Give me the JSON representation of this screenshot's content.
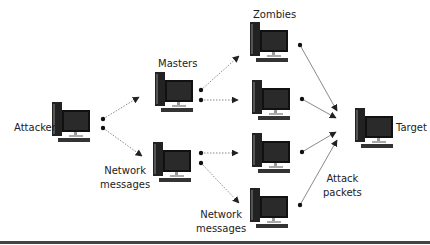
{
  "diagram": {
    "nodes": {
      "attacker": {
        "label": "Attacker"
      },
      "masters": {
        "label": "Masters",
        "count": 2
      },
      "zombies": {
        "label": "Zombies",
        "count": 4
      },
      "target": {
        "label": "Target"
      }
    },
    "annotations": {
      "network_messages_1_line1": "Network",
      "network_messages_1_line2": "messages",
      "network_messages_2_line1": "Network",
      "network_messages_2_line2": "messages",
      "attack_packets_line1": "Attack",
      "attack_packets_line2": "packets"
    },
    "edges": [
      {
        "from": "attacker",
        "to": "master-1"
      },
      {
        "from": "attacker",
        "to": "master-2"
      },
      {
        "from": "master-1",
        "to": "zombie-1"
      },
      {
        "from": "master-1",
        "to": "zombie-2"
      },
      {
        "from": "master-2",
        "to": "zombie-3"
      },
      {
        "from": "master-2",
        "to": "zombie-4"
      },
      {
        "from": "zombie-1",
        "to": "target"
      },
      {
        "from": "zombie-2",
        "to": "target"
      },
      {
        "from": "zombie-3",
        "to": "target"
      },
      {
        "from": "zombie-4",
        "to": "target"
      }
    ],
    "colors": {
      "line": "#8a8a8a",
      "node": "#1a1a1a",
      "arrow": "#222222"
    }
  }
}
